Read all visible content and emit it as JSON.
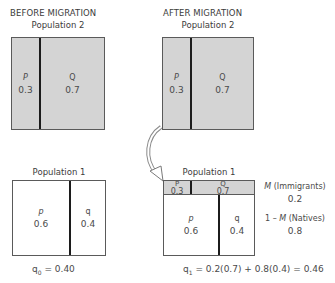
{
  "before": {
    "heading": "BEFORE MIGRATION",
    "pop2": {
      "label": "Population 2",
      "cells": [
        {
          "symbol": "P",
          "value": "0.3"
        },
        {
          "symbol": "Q",
          "value": "0.7"
        }
      ]
    },
    "pop1": {
      "label": "Population 1",
      "cells": [
        {
          "symbol": "p",
          "value": "0.6"
        },
        {
          "symbol": "q",
          "value": "0.4"
        }
      ]
    },
    "formula": {
      "lhs": "q",
      "sub": "0",
      "rhs": " = 0.40"
    }
  },
  "after": {
    "heading": "AFTER MIGRATION",
    "pop2": {
      "label": "Population 2",
      "cells": [
        {
          "symbol": "P",
          "value": "0.3"
        },
        {
          "symbol": "Q",
          "value": "0.7"
        }
      ]
    },
    "pop1": {
      "label": "Population 1",
      "immigrant_cells": [
        {
          "symbol": "P",
          "value": "0.3"
        },
        {
          "symbol": "Q",
          "value": "0.7"
        }
      ],
      "native_cells": [
        {
          "symbol": "p",
          "value": "0.6"
        },
        {
          "symbol": "q",
          "value": "0.4"
        }
      ]
    },
    "immigrants": {
      "label_m": "M",
      "label_rest": " (Immigrants)",
      "value": "0.2"
    },
    "natives": {
      "label_pre": "1 – ",
      "label_m": "M",
      "label_rest": " (Natives)",
      "value": "0.8"
    },
    "formula": {
      "lhs": "q",
      "sub": "1",
      "rhs": " = 0.2(0.7) + 0.8(0.4) = 0.46"
    }
  },
  "colors": {
    "grey_fill": "#d4d4d4",
    "divider": "#1c1c1c",
    "border": "#5a5a5a",
    "arrow": "#9a9a9a"
  }
}
